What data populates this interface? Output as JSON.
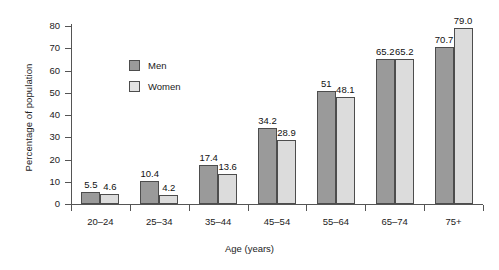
{
  "chart_data": {
    "type": "bar",
    "title": "",
    "xlabel": "Age (years)",
    "ylabel": "Percentage of population",
    "categories": [
      "20–24",
      "25–34",
      "35–44",
      "45–54",
      "55–64",
      "65–74",
      "75+"
    ],
    "series": [
      {
        "name": "Men",
        "color": "#9a9a9a",
        "values": [
          5.5,
          10.4,
          17.4,
          34.2,
          51,
          65.2,
          70.7
        ],
        "labels": [
          "5.5",
          "10.4",
          "17.4",
          "34.2",
          "51",
          "65.2",
          "70.7"
        ]
      },
      {
        "name": "Women",
        "color": "#dcdcdc",
        "values": [
          4.6,
          4.2,
          13.6,
          28.9,
          48.1,
          65.2,
          79.0
        ],
        "labels": [
          "4.6",
          "4.2",
          "13.6",
          "28.9",
          "48.1",
          "65.2",
          "79.0"
        ]
      }
    ],
    "ylim": [
      0,
      80
    ],
    "yticks": [
      0,
      10,
      20,
      30,
      40,
      50,
      60,
      70,
      80
    ],
    "ytick_labels": [
      "0",
      "10",
      "20",
      "30",
      "40",
      "50",
      "60",
      "70",
      "80"
    ],
    "grid": false,
    "legend_position": "upper-left-inside"
  },
  "legend": {
    "items": [
      {
        "label": "Men"
      },
      {
        "label": "Women"
      }
    ]
  }
}
